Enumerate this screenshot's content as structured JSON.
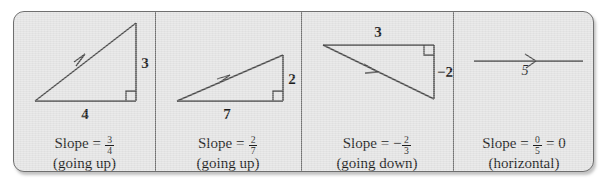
{
  "figure": {
    "type": "slope-illustration-strip",
    "background_color": "#e4e4e4",
    "border_color": "#6f6f6f",
    "line_color": "#4a4a4a",
    "text_color": "#1d1d1d",
    "panels": [
      {
        "id": "panel-positive-three-fourths",
        "rise_label": "3",
        "run_label": "4",
        "caption_prefix": "Slope =",
        "slope_sign": "",
        "numerator": "3",
        "denominator": "4",
        "caption_suffix": "",
        "description": "(going up)",
        "direction": "up",
        "slope_value": 0.75,
        "right_angle_marker": true,
        "arrow_on": "hypotenuse"
      },
      {
        "id": "panel-positive-two-sevenths",
        "rise_label": "2",
        "run_label": "7",
        "caption_prefix": "Slope =",
        "slope_sign": "",
        "numerator": "2",
        "denominator": "7",
        "caption_suffix": "",
        "description": "(going up)",
        "direction": "up",
        "slope_value": 0.2857,
        "right_angle_marker": true,
        "arrow_on": "hypotenuse"
      },
      {
        "id": "panel-negative-two-thirds",
        "rise_label": "−2",
        "run_label": "3",
        "caption_prefix": "Slope =",
        "slope_sign": "−",
        "numerator": "2",
        "denominator": "3",
        "caption_suffix": "",
        "description": "(going down)",
        "direction": "down",
        "slope_value": -0.6667,
        "right_angle_marker": true,
        "arrow_on": "hypotenuse"
      },
      {
        "id": "panel-zero-slope",
        "rise_label": "",
        "run_label": "5",
        "caption_prefix": "Slope =",
        "slope_sign": "",
        "numerator": "0",
        "denominator": "5",
        "caption_suffix": "= 0",
        "description": "(horizontal)",
        "direction": "horizontal",
        "slope_value": 0,
        "right_angle_marker": false,
        "arrow_on": "horizontal-line"
      }
    ]
  }
}
